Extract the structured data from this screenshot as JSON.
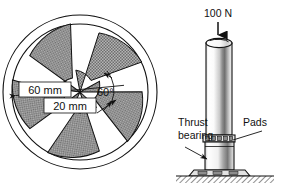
{
  "figure": {
    "background_color": "#ffffff",
    "line_color": "#111111",
    "pad_fill_color": "#9a9a9a"
  },
  "plan_view": {
    "name": "sector-pad-thrust-bearing-plan",
    "pad_count": 5,
    "pad_included_angle_deg": 60,
    "pad_spacing_deg": 72,
    "dimensions": {
      "outer_diameter_label": "60 mm",
      "inner_diameter_label": "20 mm",
      "pad_angle_label": "60°"
    }
  },
  "elevation_view": {
    "name": "vertical-shaft-thrust-bearing-elevation",
    "load_label": "100 N",
    "thrust_bearing_label_line1": "Thrust",
    "thrust_bearing_label_line2": "bearing",
    "pads_label": "Pads"
  }
}
